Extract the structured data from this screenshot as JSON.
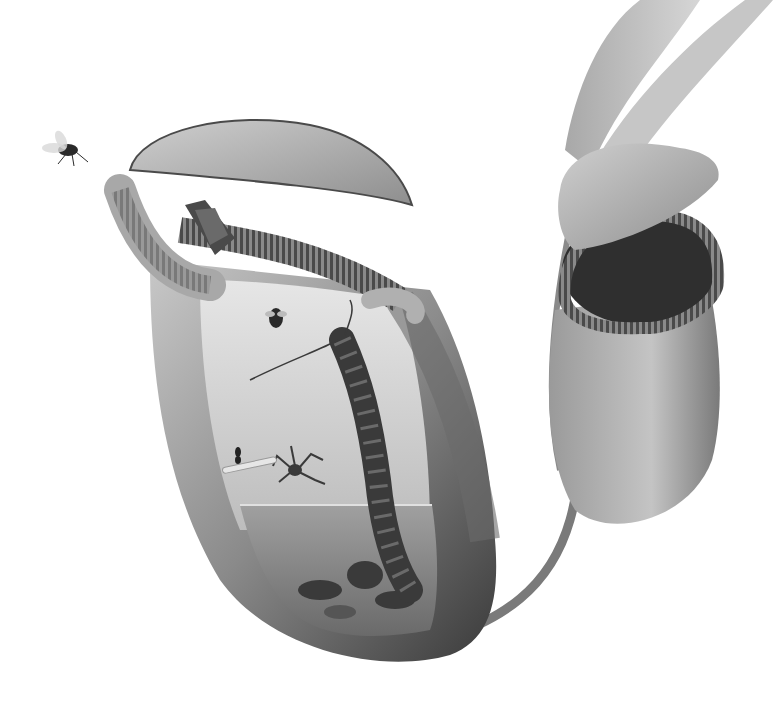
{
  "image": {
    "description": "Grayscale illustration of two Nepenthes pitcher plants; the large foreground pitcher is shown in cutaway revealing trapped insects, a centipede, and digestive fluid",
    "width": 773,
    "height": 710,
    "palette": {
      "background": "#ffffff",
      "light_tissue": "#d9d9d9",
      "mid_tissue": "#9a9a9a",
      "dark_tissue": "#4a4a4a",
      "shadow": "#2a2a2a",
      "fluid": "#8c8c8c"
    }
  },
  "subjects": [
    {
      "name": "flying-fly",
      "position": "upper-left"
    },
    {
      "name": "main-pitcher",
      "position": "center-left",
      "features": [
        "open lid",
        "ribbed peristome",
        "cutaway interior",
        "digestive fluid",
        "trapped insects"
      ]
    },
    {
      "name": "moth-on-rim",
      "position": "top of main pitcher rim"
    },
    {
      "name": "fly-inside-pitcher",
      "position": "inner wall"
    },
    {
      "name": "centipede",
      "position": "inner right wall of main pitcher"
    },
    {
      "name": "spider",
      "position": "at fluid surface"
    },
    {
      "name": "ant",
      "position": "inner wall near fluid"
    },
    {
      "name": "secondary-pitcher",
      "position": "right",
      "features": [
        "lid",
        "dark ribbed peristome"
      ]
    },
    {
      "name": "leaves-and-tendril",
      "position": "upper-right connecting to main pitcher"
    }
  ]
}
